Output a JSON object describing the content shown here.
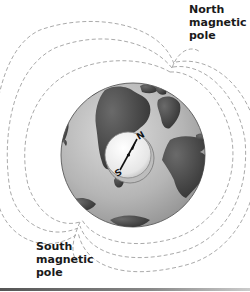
{
  "figure": {
    "labels": {
      "north_pole": [
        "North",
        "magnetic",
        "pole"
      ],
      "south_pole": [
        "South",
        "magnetic",
        "pole"
      ]
    },
    "compass": {
      "north_letter": "N",
      "south_letter": "S"
    },
    "colors": {
      "ocean": "#b9b9b9",
      "land": "#4a4a4a",
      "field_lines": "#9a9a9a",
      "compass_face": "#ececec",
      "text": "#1a1a1a"
    }
  }
}
